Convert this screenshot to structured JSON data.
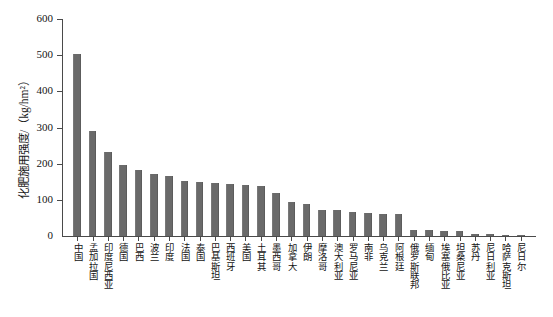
{
  "chart_data": {
    "type": "bar",
    "title": "",
    "subtitle": "",
    "xlabel": "",
    "ylabel": "化肥施用强度/（kg/hm²）",
    "ylim": [
      0,
      600
    ],
    "yticks": [
      0,
      100,
      200,
      300,
      400,
      500,
      600
    ],
    "ytick_labels": [
      "0",
      "100",
      "200",
      "300",
      "400",
      "500",
      "600"
    ],
    "grid": false,
    "legend": null,
    "bar_color": "#6a6a6a",
    "axis_color": "#4a4a4a",
    "categories": [
      "中国",
      "孟加拉国",
      "印度尼西亚",
      "德国",
      "巴西",
      "波兰",
      "印度",
      "法国",
      "泰国",
      "巴基斯坦",
      "西班牙",
      "美国",
      "土耳其",
      "墨西哥",
      "加拿大",
      "伊朗",
      "摩洛哥",
      "澳大利亚",
      "罗马尼亚",
      "南非",
      "乌克兰",
      "阿根廷",
      "俄罗斯联邦",
      "缅甸",
      "埃塞俄比亚",
      "坦桑尼亚",
      "苏丹",
      "尼日利亚",
      "哈萨克斯坦",
      "尼日尔"
    ],
    "values": [
      503,
      289,
      232,
      196,
      183,
      172,
      166,
      152,
      150,
      147,
      144,
      140,
      138,
      120,
      93,
      89,
      73,
      71,
      67,
      65,
      62,
      61,
      17,
      17,
      14,
      13,
      6,
      5,
      4,
      2
    ],
    "value_unit": "kg/hm²"
  }
}
